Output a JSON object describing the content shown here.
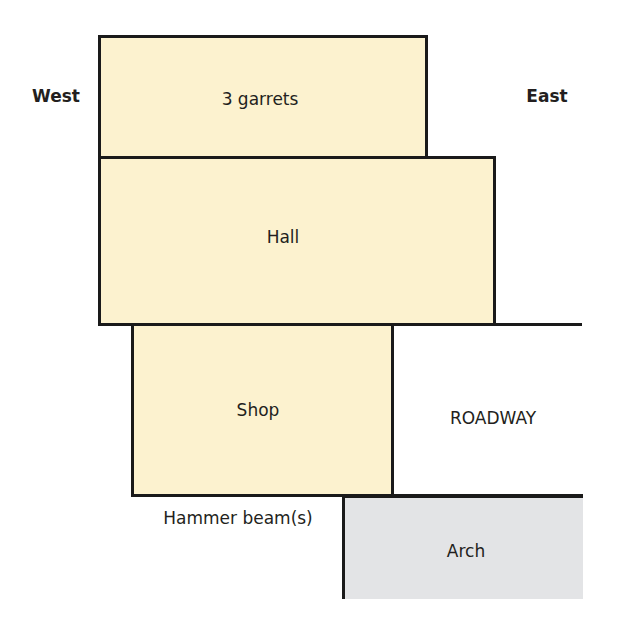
{
  "diagram": {
    "type": "building-section-plan",
    "orientation": {
      "west": "West",
      "east": "East"
    },
    "rooms": [
      {
        "id": "garrets",
        "label": "3 garrets",
        "fill": "#fcf2cf"
      },
      {
        "id": "hall",
        "label": "Hall",
        "fill": "#fcf2cf"
      },
      {
        "id": "shop",
        "label": "Shop",
        "fill": "#fcf2cf"
      },
      {
        "id": "arch",
        "label": "Arch",
        "fill": "#e3e4e6"
      }
    ],
    "annotations": {
      "roadway": "ROADWAY",
      "hammer_beams": "Hammer beam(s)"
    },
    "colors": {
      "room_fill": "#fcf2cf",
      "arch_fill": "#e3e4e6",
      "outline": "#1a1a1a"
    }
  }
}
